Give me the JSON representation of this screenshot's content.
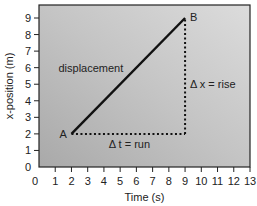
{
  "chart_data": {
    "type": "line",
    "title": "",
    "xlabel": "Time (s)",
    "ylabel": "x-position (m)",
    "xlim": [
      0,
      13
    ],
    "ylim": [
      0,
      9.5
    ],
    "x_ticks": [
      0,
      1,
      2,
      3,
      4,
      5,
      6,
      7,
      8,
      9,
      10,
      11,
      12,
      13
    ],
    "y_ticks": [
      0,
      1,
      2,
      3,
      4,
      5,
      6,
      7,
      8,
      9
    ],
    "grid": false,
    "series": [
      {
        "name": "displacement",
        "x": [
          2,
          9
        ],
        "y": [
          2,
          9
        ],
        "style": "solid"
      }
    ],
    "points": [
      {
        "label": "A",
        "x": 2,
        "y": 2
      },
      {
        "label": "B",
        "x": 9,
        "y": 9
      }
    ],
    "guides": [
      {
        "name": "run",
        "from": [
          2,
          2
        ],
        "to": [
          9,
          2
        ],
        "style": "dotted"
      },
      {
        "name": "rise",
        "from": [
          9,
          2
        ],
        "to": [
          9,
          9
        ],
        "style": "dotted"
      }
    ],
    "annotations": [
      {
        "text": "displacement",
        "x": 1.2,
        "y": 6
      },
      {
        "text": "Δ x = rise",
        "x": 9.3,
        "y": 5
      },
      {
        "text": "Δ t = run",
        "x": 4.3,
        "y": 1.4
      }
    ]
  }
}
